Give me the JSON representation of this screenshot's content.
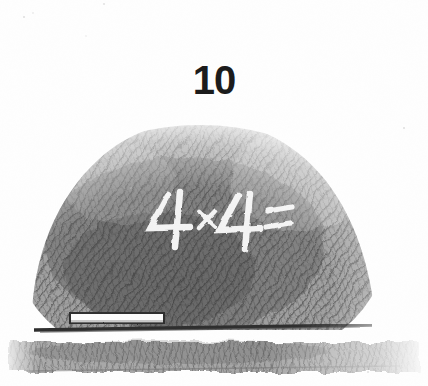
{
  "figure": {
    "number": "10"
  },
  "blackboard": {
    "chalk_equation": "4×4=",
    "chalk_stick_label": "chalk stick",
    "ledge_label": "chalk ledge",
    "board_label": "blackboard"
  },
  "colors": {
    "background": "#fefefe",
    "number_ink": "#1b1b1b",
    "board_dark": "#5a5a5a",
    "board_mid": "#7d7d7d",
    "board_light": "#bdbdbd",
    "chalk_white": "#fdfdfd",
    "baseline_ink": "#3a3a3a",
    "ledge_shade": "#8e8e8e"
  },
  "medium": {
    "technique": "pencil hatching",
    "subject": "blackboard with multiplication problem"
  }
}
